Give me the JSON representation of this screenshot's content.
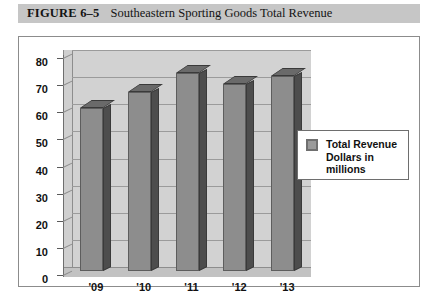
{
  "caption": {
    "figure_number": "FIGURE 6–5",
    "title": "Southeastern Sporting Goods Total Revenue"
  },
  "legend": {
    "swatch_color": "#9a9a9a",
    "text": "Total Revenue\nDollars in\nmillions"
  },
  "colors": {
    "bar_front": "#8d8d8d",
    "bar_side": "#4d4d4d",
    "bar_top": "#6a6a6a",
    "plot_background": "#d2d2d2",
    "caption_band": "#c6c6c6",
    "frame_border": "#8c8c8c"
  },
  "chart_data": {
    "type": "bar",
    "title": "Southeastern Sporting Goods Total Revenue",
    "xlabel": "",
    "ylabel": "",
    "categories": [
      "'09",
      "'10",
      "'11",
      "'12",
      "'13"
    ],
    "values": [
      60,
      66,
      73,
      69,
      72
    ],
    "series": [
      {
        "name": "Total Revenue Dollars in millions",
        "values": [
          60,
          66,
          73,
          69,
          72
        ]
      }
    ],
    "ylim": [
      0,
      80
    ],
    "yticks": [
      0,
      10,
      20,
      30,
      40,
      50,
      60,
      70,
      80
    ],
    "ytick_labels": [
      "0",
      "10",
      "20",
      "30",
      "40",
      "50",
      "60",
      "70",
      "80"
    ],
    "grid": true,
    "legend_position": "right",
    "three_d": true,
    "units": "millions of dollars"
  }
}
